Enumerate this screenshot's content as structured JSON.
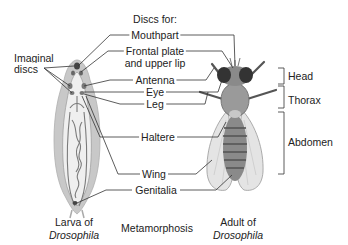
{
  "diagram": {
    "header": "Discs for:",
    "imaginal_discs_label": "Imaginal\ndiscs",
    "imaginal_discs_line1": "Imaginal",
    "imaginal_discs_line2": "discs",
    "disc_labels": [
      {
        "id": "mouthpart",
        "text": "Mouthpart"
      },
      {
        "id": "frontal-plate",
        "text_line1": "Frontal plate",
        "text_line2": "and upper lip"
      },
      {
        "id": "antenna",
        "text": "Antenna"
      },
      {
        "id": "eye",
        "text": "Eye"
      },
      {
        "id": "leg",
        "text": "Leg"
      },
      {
        "id": "haltere",
        "text": "Haltere"
      },
      {
        "id": "wing",
        "text": "Wing"
      },
      {
        "id": "genitalia",
        "text": "Genitalia"
      }
    ],
    "body_regions": [
      {
        "id": "head",
        "text": "Head"
      },
      {
        "id": "thorax",
        "text": "Thorax"
      },
      {
        "id": "abdomen",
        "text": "Abdomen"
      }
    ],
    "captions": {
      "larva_line1": "Larva of",
      "larva_line2": "Drosophila",
      "middle": "Metamorphosis",
      "adult_line1": "Adult of",
      "adult_line2": "Drosophila"
    },
    "colors": {
      "larva_outer": "#c8c8c8",
      "larva_inner": "#efefef",
      "gut_lines": "#7a7a7a",
      "disc_dark": "#555555",
      "leader_lines": "#333333",
      "fly_body": "#8a8a8a",
      "fly_wing": "#e4e4e4"
    }
  }
}
